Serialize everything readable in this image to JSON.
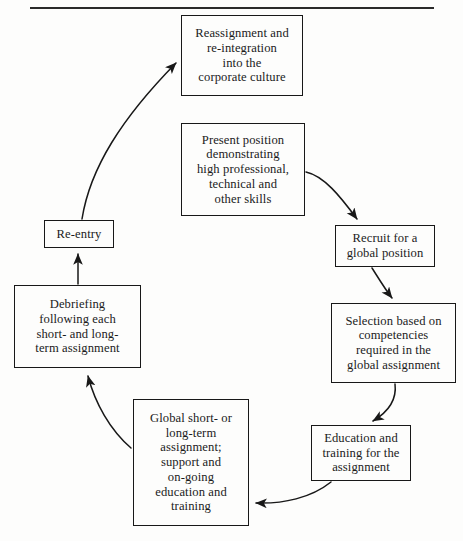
{
  "diagram": {
    "type": "cycle-flowchart",
    "top_rule": true,
    "stroke_color": "#181818",
    "background_color": "#fdfdfc",
    "nodes": [
      {
        "id": "reassignment",
        "label": "Reassignment and\nre-integration\ninto the\ncorporate culture"
      },
      {
        "id": "present",
        "label": "Present position\ndemonstrating\nhigh professional,\ntechnical and\nother skills"
      },
      {
        "id": "recruit",
        "label": "Recruit for a\nglobal position"
      },
      {
        "id": "selection",
        "label": "Selection based on\ncompetencies\nrequired in the\nglobal assignment"
      },
      {
        "id": "education",
        "label": "Education and\ntraining for the\nassignment"
      },
      {
        "id": "global",
        "label": "Global short- or\nlong-term\nassignment;\nsupport and\non-going\neducation and\ntraining"
      },
      {
        "id": "debriefing",
        "label": "Debriefing\nfollowing each\nshort- and long-\nterm assignment"
      },
      {
        "id": "reentry",
        "label": "Re-entry"
      }
    ],
    "edges": [
      {
        "from": "present",
        "to": "recruit",
        "style": "curved-arrow"
      },
      {
        "from": "recruit",
        "to": "selection",
        "style": "curved-arrow"
      },
      {
        "from": "selection",
        "to": "education",
        "style": "curved-arrow"
      },
      {
        "from": "education",
        "to": "global",
        "style": "curved-arrow"
      },
      {
        "from": "global",
        "to": "debriefing",
        "style": "curved-arrow"
      },
      {
        "from": "debriefing",
        "to": "reentry",
        "style": "straight-arrow"
      },
      {
        "from": "reentry",
        "to": "reassignment",
        "style": "curved-arrow"
      }
    ]
  }
}
